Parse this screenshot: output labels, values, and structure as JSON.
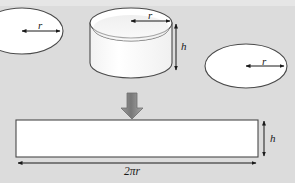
{
  "figure": {
    "background_color": "#dcdcdc",
    "shape_fill": "#ffffff",
    "stroke_color": "#4a4a4a",
    "arrow_color": "#8a8a8a",
    "dimension_color": "#1a1a1a",
    "labels": {
      "left_circle_radius": "r",
      "cylinder_radius": "r",
      "right_circle_radius": "r",
      "cylinder_height": "h",
      "rectangle_height": "h",
      "rectangle_width": "2πr"
    },
    "parts": [
      {
        "name": "left-circle",
        "kind": "ellipse",
        "label": "r",
        "cx": 22,
        "cy": 31,
        "rx": 41,
        "ry": 23
      },
      {
        "name": "cylinder",
        "kind": "cylinder",
        "label_radius": "r",
        "label_height": "h",
        "cx": 131,
        "top_cy": 23,
        "rx": 41,
        "ry": 15,
        "body_height": 40
      },
      {
        "name": "right-circle",
        "kind": "ellipse",
        "label": "r",
        "cx": 246,
        "cy": 66,
        "rx": 41,
        "ry": 22
      },
      {
        "name": "unrolled-rectangle",
        "kind": "rect",
        "label_width": "2πr",
        "label_height": "h",
        "x": 16,
        "y": 120,
        "width": 242,
        "height": 37
      },
      {
        "name": "transform-arrow",
        "kind": "block-arrow",
        "direction": "down",
        "x": 126,
        "y": 93,
        "width": 12,
        "height": 25
      }
    ],
    "math": {
      "relation": "Lateral surface of a cylinder unrolls into a rectangle of width 2πr and height h"
    }
  }
}
